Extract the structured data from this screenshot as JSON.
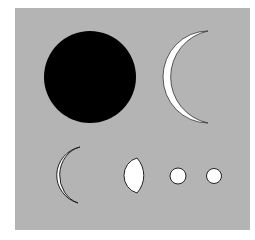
{
  "figure": {
    "background_color": "#b4b4b4",
    "page_color": "#ffffff",
    "shapes": [
      {
        "name": "full-dark-disc",
        "kind": "circle",
        "fill": "#000000"
      },
      {
        "name": "thin-crescent-large",
        "kind": "crescent",
        "fill": "#ffffff"
      },
      {
        "name": "crescent-medium",
        "kind": "crescent",
        "fill": "#ffffff"
      },
      {
        "name": "half-phase-gibbous",
        "kind": "half-disc",
        "fill": "#ffffff"
      },
      {
        "name": "full-disc-small-1",
        "kind": "circle",
        "fill": "#ffffff"
      },
      {
        "name": "full-disc-small-2",
        "kind": "circle",
        "fill": "#ffffff"
      }
    ]
  }
}
